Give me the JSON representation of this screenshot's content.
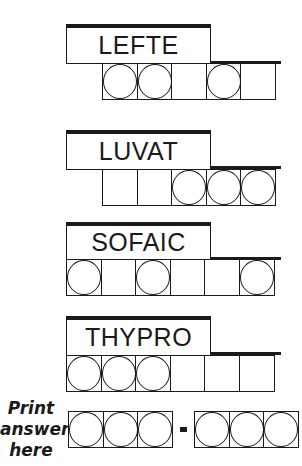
{
  "puzzles": [
    {
      "scrambled": "LEFTE",
      "circled": [
        true,
        true,
        false,
        true,
        false
      ]
    },
    {
      "scrambled": "LUVAT",
      "circled": [
        false,
        false,
        true,
        true,
        true
      ]
    },
    {
      "scrambled": "SOFAIC",
      "circled": [
        true,
        false,
        true,
        false,
        false,
        true
      ]
    },
    {
      "scrambled": "THYPRO",
      "circled": [
        true,
        true,
        true,
        false,
        false,
        false
      ]
    }
  ],
  "answer": {
    "label_lines": [
      "Print",
      "answer",
      "here"
    ],
    "group1_cells": 3,
    "separator": "-",
    "group2_cells": 3
  }
}
